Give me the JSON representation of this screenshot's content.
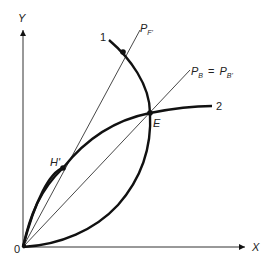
{
  "diagram": {
    "axes": {
      "x_label": "X",
      "y_label": "Y",
      "origin_label": "0"
    },
    "curves": [
      {
        "id": "curve-1",
        "label": "1"
      },
      {
        "id": "curve-2",
        "label": "2"
      }
    ],
    "rays": [
      {
        "id": "ray-pf",
        "label_main": "P",
        "label_sub": "F'"
      },
      {
        "id": "ray-pb",
        "label_main": "P",
        "label_sub": "B",
        "eq": "=",
        "label_main2": "P",
        "label_sub2": "B'"
      }
    ],
    "points": [
      {
        "id": "point-e",
        "label": "E"
      },
      {
        "id": "point-h",
        "label": "H'"
      },
      {
        "id": "point-top",
        "label": ""
      }
    ],
    "colors": {
      "ink": "#111111",
      "thin": "#333333"
    }
  }
}
